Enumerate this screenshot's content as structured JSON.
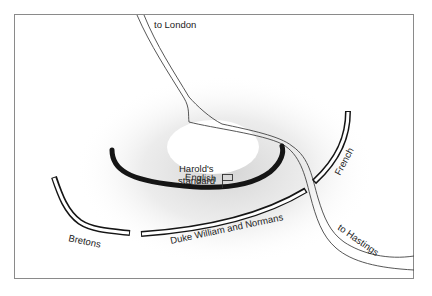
{
  "map": {
    "title": "Battle of Hastings positions",
    "colors": {
      "background": "#ffffff",
      "frame": "#8a8a8a",
      "ink": "#1a1a1a",
      "hill_shading": "#d9d9d9",
      "hilltop": "#ffffff"
    },
    "labels": {
      "to_london": "to London",
      "harold_line1": "Harold's",
      "harold_line2": "standard",
      "english": "English",
      "french": "French",
      "bretons": "Bretons",
      "normans": "Duke William and Normans",
      "to_hastings": "to Hastings"
    },
    "features": [
      {
        "id": "road",
        "type": "road",
        "from": "to London",
        "to": "to Hastings"
      },
      {
        "id": "english-line",
        "type": "army",
        "name": "English",
        "style": "solid-thick"
      },
      {
        "id": "french-line",
        "type": "army",
        "name": "French",
        "style": "outlined"
      },
      {
        "id": "bretons-line",
        "type": "army",
        "name": "Bretons",
        "style": "outlined"
      },
      {
        "id": "normans-line",
        "type": "army",
        "name": "Duke William and Normans",
        "style": "outlined"
      },
      {
        "id": "standard",
        "type": "marker",
        "name": "Harold's standard",
        "icon": "flag-icon"
      }
    ]
  }
}
